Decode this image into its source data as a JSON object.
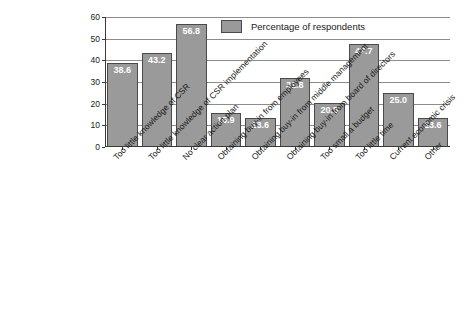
{
  "chart_data": {
    "type": "bar",
    "title": "",
    "subtitle": "",
    "xlabel": "",
    "ylabel": "",
    "ylim": [
      0,
      60
    ],
    "yticks": [
      0,
      10,
      20,
      30,
      40,
      50,
      60
    ],
    "grid": true,
    "legend_position": "top-right",
    "legend": [
      "Percentage of respondents"
    ],
    "bar_color": "#9a9a9a",
    "bar_edge_color": "#4a4a4a",
    "value_label_color": "#ffffff",
    "categories": [
      "Too little knowledge of CSR",
      "Too little knowledge of CSR implementation",
      "No clear action plan",
      "Obtaining buy-in from employees",
      "Obtaining buy-in from middle management",
      "Obtaining buy-in from board of directors",
      "Too small a budget",
      "Too little time",
      "Current economic crisis",
      "Other"
    ],
    "series": [
      {
        "name": "Percentage of respondents",
        "values": [
          38.6,
          43.2,
          56.8,
          15.9,
          13.6,
          31.8,
          20.5,
          47.7,
          25.0,
          13.6
        ]
      }
    ],
    "data_labels": [
      "38.6",
      "43.2",
      "56.8",
      "15.9",
      "13.6",
      "31.8",
      "20.5",
      "47.7",
      "25.0",
      "13.6"
    ],
    "ytick_labels": [
      "0",
      "10",
      "20",
      "30",
      "40",
      "50",
      "60"
    ]
  }
}
